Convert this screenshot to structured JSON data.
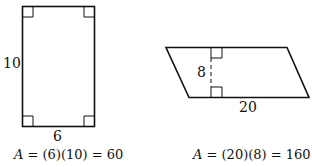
{
  "figures": [
    {
      "shape": "rectangle",
      "side_label": "10",
      "bottom_label": "6",
      "formula_var": "A",
      "formula_rest": " = (6)(10) = 60"
    },
    {
      "shape": "parallelogram",
      "height_label": "8",
      "base_label": "20",
      "formula_var": "A",
      "formula_rest": " = (20)(8) = 160"
    }
  ],
  "colors": {
    "stroke": "#111111",
    "background": "#ffffff"
  }
}
